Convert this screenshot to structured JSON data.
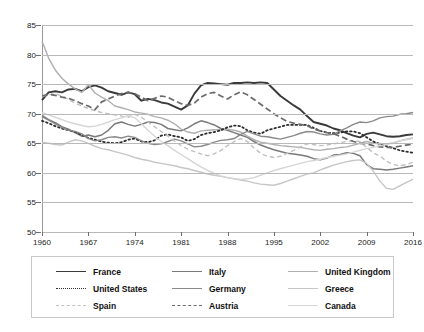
{
  "chart_data": {
    "type": "line",
    "title": "",
    "xlabel": "",
    "ylabel": "",
    "xlim": [
      1960,
      2016
    ],
    "ylim": [
      50,
      85
    ],
    "grid": true,
    "legend_position": "bottom",
    "xticks": [
      "1960",
      "1967",
      "1974",
      "1981",
      "1988",
      "1995",
      "2002",
      "2009",
      "2016"
    ],
    "yticks": [
      "50",
      "55",
      "60",
      "65",
      "70",
      "75",
      "80",
      "85"
    ],
    "x": [
      1960,
      1961,
      1962,
      1963,
      1964,
      1965,
      1966,
      1967,
      1968,
      1969,
      1970,
      1971,
      1972,
      1973,
      1974,
      1975,
      1976,
      1977,
      1978,
      1979,
      1980,
      1981,
      1982,
      1983,
      1984,
      1985,
      1986,
      1987,
      1988,
      1989,
      1990,
      1991,
      1992,
      1993,
      1994,
      1995,
      1996,
      1997,
      1998,
      1999,
      2000,
      2001,
      2002,
      2003,
      2004,
      2005,
      2006,
      2007,
      2008,
      2009,
      2010,
      2011,
      2012,
      2013,
      2014,
      2015,
      2016
    ],
    "series": [
      {
        "name": "France",
        "style": "solid",
        "color": "#3a3a3a",
        "width": 1.9,
        "values": [
          72.3,
          73.6,
          73.8,
          73.6,
          74.1,
          74.2,
          73.8,
          74.5,
          74.8,
          74.4,
          73.8,
          73.5,
          73.2,
          73.6,
          73.3,
          72.2,
          72.5,
          72.3,
          71.9,
          71.7,
          71.2,
          70.7,
          71.4,
          73.4,
          74.8,
          75.2,
          75.1,
          75.0,
          74.9,
          75.2,
          75.2,
          75.3,
          75.2,
          75.3,
          75.2,
          74.1,
          73.0,
          72.2,
          71.4,
          70.7,
          69.6,
          68.6,
          68.3,
          68.0,
          67.5,
          67.2,
          66.7,
          66.3,
          66.0,
          66.6,
          66.8,
          66.5,
          66.2,
          66.1,
          66.2,
          66.4,
          66.5
        ]
      },
      {
        "name": "Italy",
        "style": "solid",
        "color": "#7a7a7a",
        "width": 1.5,
        "values": [
          69.7,
          69.0,
          68.5,
          67.8,
          67.4,
          66.8,
          66.2,
          66.4,
          66.1,
          66.4,
          67.2,
          68.3,
          68.6,
          68.2,
          67.9,
          68.2,
          68.6,
          68.5,
          68.2,
          67.5,
          67.3,
          67.1,
          67.6,
          68.3,
          68.8,
          68.5,
          68.1,
          67.5,
          67.2,
          66.8,
          66.4,
          66.0,
          65.3,
          64.7,
          64.3,
          63.9,
          63.6,
          63.3,
          63.2,
          63.0,
          62.8,
          62.4,
          62.2,
          62.5,
          63.0,
          63.1,
          63.4,
          63.3,
          62.9,
          61.4,
          60.7,
          60.6,
          60.5,
          60.6,
          60.8,
          61.0,
          61.2
        ]
      },
      {
        "name": "United Kingdom",
        "style": "solid",
        "color": "#b0b0b0",
        "width": 1.4,
        "values": [
          82.3,
          79.4,
          77.4,
          76.0,
          75.0,
          74.2,
          73.6,
          74.9,
          73.5,
          72.8,
          72.2,
          71.3,
          71.0,
          70.7,
          70.3,
          70.1,
          69.9,
          69.5,
          69.3,
          68.9,
          68.3,
          67.4,
          66.9,
          66.7,
          67.1,
          67.2,
          67.3,
          67.3,
          67.4,
          67.2,
          66.9,
          66.2,
          65.6,
          65.2,
          65.0,
          64.8,
          64.6,
          64.5,
          64.4,
          64.3,
          64.1,
          63.9,
          63.8,
          64.0,
          64.1,
          64.3,
          64.4,
          64.7,
          65.0,
          65.3,
          65.0,
          64.9,
          64.9,
          65.0,
          65.4,
          65.7,
          65.9
        ]
      },
      {
        "name": "United States",
        "style": "dotted",
        "color": "#2e2e2e",
        "width": 1.8,
        "values": [
          68.8,
          68.4,
          67.9,
          67.5,
          67.2,
          66.9,
          66.4,
          65.9,
          65.6,
          65.3,
          65.1,
          65.0,
          65.2,
          65.6,
          65.8,
          65.3,
          65.2,
          65.5,
          66.3,
          66.5,
          66.2,
          66.0,
          65.4,
          65.7,
          66.4,
          66.7,
          66.9,
          67.2,
          67.7,
          68.0,
          67.9,
          67.2,
          66.8,
          66.6,
          67.2,
          67.5,
          67.8,
          68.1,
          68.1,
          68.1,
          68.1,
          67.6,
          67.1,
          66.8,
          66.7,
          66.8,
          67.0,
          67.0,
          66.7,
          66.0,
          65.3,
          64.9,
          64.5,
          64.2,
          63.8,
          63.6,
          63.4
        ]
      },
      {
        "name": "Germany",
        "style": "solid",
        "color": "#8a8a8a",
        "width": 1.4,
        "values": [
          69.5,
          68.9,
          68.3,
          67.7,
          67.2,
          67.0,
          66.6,
          65.8,
          65.4,
          65.6,
          66.0,
          66.1,
          65.9,
          66.2,
          66.0,
          65.4,
          65.0,
          64.8,
          64.9,
          65.3,
          65.7,
          65.4,
          64.9,
          64.4,
          64.5,
          64.8,
          65.2,
          65.5,
          65.6,
          65.8,
          66.5,
          67.0,
          66.6,
          66.2,
          66.1,
          65.9,
          65.7,
          66.0,
          66.3,
          66.7,
          67.0,
          66.9,
          66.6,
          66.4,
          66.5,
          67.1,
          67.6,
          68.2,
          68.6,
          68.5,
          68.8,
          69.3,
          69.5,
          69.6,
          69.9,
          70.0,
          70.2
        ]
      },
      {
        "name": "Greece",
        "style": "solid",
        "color": "#c6c6c6",
        "width": 1.4,
        "values": [
          65.2,
          65.0,
          64.8,
          64.7,
          65.2,
          65.6,
          65.4,
          65.0,
          64.5,
          64.1,
          63.9,
          63.6,
          63.3,
          63.0,
          62.6,
          62.3,
          62.1,
          61.8,
          61.6,
          61.4,
          61.2,
          60.9,
          60.7,
          60.4,
          60.1,
          59.8,
          59.6,
          59.4,
          59.2,
          59.0,
          58.8,
          58.6,
          58.3,
          58.1,
          58.0,
          57.9,
          58.2,
          58.6,
          59.0,
          59.4,
          59.8,
          60.0,
          60.5,
          60.9,
          61.3,
          61.6,
          61.9,
          62.1,
          62.2,
          61.6,
          60.3,
          58.6,
          57.4,
          57.2,
          57.8,
          58.4,
          58.9
        ]
      },
      {
        "name": "Spain",
        "style": "dashed-light",
        "color": "#c0c0c0",
        "width": 1.4,
        "values": [
          72.9,
          73.2,
          73.4,
          73.0,
          72.4,
          71.8,
          71.3,
          70.9,
          70.5,
          70.2,
          70.0,
          69.8,
          69.6,
          69.4,
          69.9,
          69.4,
          68.6,
          67.8,
          67.0,
          66.2,
          65.4,
          64.6,
          64.0,
          63.6,
          63.2,
          62.9,
          63.2,
          63.8,
          64.6,
          65.3,
          65.8,
          65.3,
          64.2,
          63.3,
          62.8,
          62.6,
          62.8,
          63.3,
          63.8,
          64.4,
          64.9,
          64.8,
          64.6,
          64.7,
          64.9,
          65.1,
          65.3,
          65.5,
          65.3,
          64.3,
          63.4,
          62.8,
          62.0,
          61.4,
          61.2,
          61.4,
          61.8
        ]
      },
      {
        "name": "Austria",
        "style": "dashed",
        "color": "#6b6b6b",
        "width": 1.7,
        "values": [
          73.0,
          73.3,
          73.1,
          72.8,
          72.6,
          72.2,
          71.7,
          71.3,
          70.7,
          72.0,
          72.5,
          73.0,
          73.4,
          73.6,
          73.4,
          72.8,
          72.2,
          72.6,
          73.0,
          72.8,
          72.2,
          71.7,
          71.4,
          71.8,
          72.8,
          73.4,
          73.6,
          73.0,
          72.5,
          73.2,
          73.7,
          73.2,
          72.4,
          71.6,
          70.8,
          70.0,
          69.3,
          68.7,
          68.4,
          68.2,
          68.0,
          67.4,
          67.1,
          66.8,
          66.6,
          66.2,
          65.7,
          65.3,
          65.0,
          64.9,
          64.6,
          64.4,
          64.3,
          64.3,
          64.5,
          64.7,
          64.9
        ]
      },
      {
        "name": "Canada",
        "style": "solid",
        "color": "#d6d6d6",
        "width": 1.4,
        "values": [
          70.2,
          69.8,
          69.4,
          69.0,
          68.6,
          68.3,
          68.0,
          67.8,
          67.9,
          68.2,
          68.6,
          69.0,
          69.3,
          69.7,
          69.3,
          68.3,
          67.2,
          66.2,
          65.3,
          64.6,
          63.8,
          63.1,
          62.4,
          61.7,
          61.0,
          60.4,
          59.9,
          59.5,
          59.2,
          59.0,
          58.9,
          59.0,
          59.2,
          59.6,
          60.0,
          60.4,
          60.7,
          61.0,
          61.3,
          61.6,
          61.9,
          62.1,
          62.3,
          62.6,
          62.8,
          63.0,
          63.2,
          63.5,
          63.8,
          64.1,
          64.3,
          64.6,
          64.8,
          65.1,
          65.4,
          65.6,
          65.8
        ]
      }
    ]
  },
  "legend": {
    "entries": [
      {
        "label": "France",
        "key": "France"
      },
      {
        "label": "Italy",
        "key": "Italy"
      },
      {
        "label": "United Kingdom",
        "key": "United Kingdom"
      },
      {
        "label": "United States",
        "key": "United States"
      },
      {
        "label": "Germany",
        "key": "Germany"
      },
      {
        "label": "Greece",
        "key": "Greece"
      },
      {
        "label": "Spain",
        "key": "Spain"
      },
      {
        "label": "Austria",
        "key": "Austria"
      },
      {
        "label": "Canada",
        "key": "Canada"
      }
    ]
  }
}
